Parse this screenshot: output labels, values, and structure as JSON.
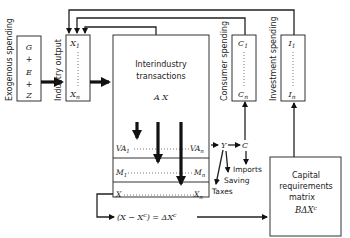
{
  "exogenous": {
    "label": "Exogenous spending",
    "items": [
      "G",
      "+",
      "E",
      "+",
      "Z"
    ]
  },
  "industry_output": {
    "label": "Industry output",
    "top": "X",
    "top_sub": "1",
    "bottom": "X",
    "bottom_sub": "n"
  },
  "interindustry": {
    "title_line1": "Interindustry",
    "title_line2": "transactions",
    "formula": "A X",
    "rows": [
      {
        "left": "VA",
        "left_sub": "1",
        "right": "VA",
        "right_sub": "n"
      },
      {
        "left": "M",
        "left_sub": "1",
        "right": "M",
        "right_sub": "n"
      },
      {
        "left": "X",
        "left_sub": "",
        "right": "X",
        "right_sub": "n"
      }
    ]
  },
  "consumer": {
    "label": "Consumer spending",
    "top": "C",
    "top_sub": "1",
    "bottom": "C",
    "bottom_sub": "n"
  },
  "investment": {
    "label": "Investment spending",
    "top": "I",
    "top_sub": "1",
    "bottom": "I",
    "bottom_sub": "n"
  },
  "flows": {
    "Y": "Y",
    "C": "C",
    "imports": "Imports",
    "saving": "Saving",
    "taxes": "Taxes",
    "delta_eq": "(X − X",
    "delta_eq_sup": "c",
    "delta_eq_mid": ") = ΔX",
    "delta_eq_sup2": "c"
  },
  "capital": {
    "line1": "Capital",
    "line2": "requirements",
    "line3": "matrix",
    "formula": "BΔX",
    "formula_sup": "c"
  }
}
